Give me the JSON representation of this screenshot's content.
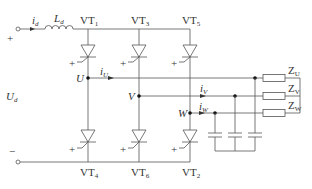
{
  "diagram": {
    "type": "three-phase current-source inverter circuit",
    "source": {
      "voltage_label": "U",
      "voltage_sub": "d",
      "current_label": "i",
      "current_sub": "d",
      "plus": "+",
      "minus": "−"
    },
    "inductor": {
      "label": "L",
      "sub": "d"
    },
    "thyristors": [
      {
        "label": "VT",
        "sub": "1"
      },
      {
        "label": "VT",
        "sub": "3"
      },
      {
        "label": "VT",
        "sub": "5"
      },
      {
        "label": "VT",
        "sub": "4"
      },
      {
        "label": "VT",
        "sub": "6"
      },
      {
        "label": "VT",
        "sub": "2"
      }
    ],
    "nodes": [
      {
        "label": "U"
      },
      {
        "label": "V"
      },
      {
        "label": "W"
      }
    ],
    "phase_currents": [
      {
        "label": "i",
        "sub": "U"
      },
      {
        "label": "i",
        "sub": "V"
      },
      {
        "label": "i",
        "sub": "W"
      }
    ],
    "loads": [
      {
        "label": "Z",
        "sub": "U"
      },
      {
        "label": "Z",
        "sub": "V"
      },
      {
        "label": "Z",
        "sub": "W"
      }
    ],
    "gate_sign": "+"
  }
}
